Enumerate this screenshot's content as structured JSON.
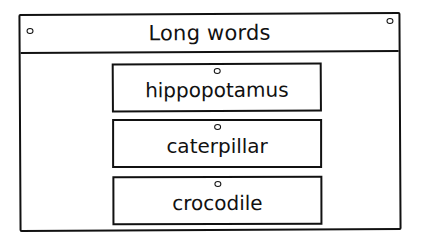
{
  "board": {
    "title": "Long words",
    "cards": [
      {
        "label": "hippopotamus"
      },
      {
        "label": "caterpillar"
      },
      {
        "label": "crocodile"
      }
    ]
  }
}
